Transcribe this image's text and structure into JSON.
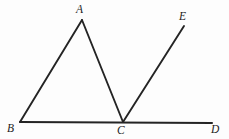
{
  "figure": {
    "kind": "geometry-line-diagram",
    "width": 229,
    "height": 139,
    "background_color": "#fdfdfd",
    "stroke_color": "#242424",
    "label_color": "#1c1c1c"
  },
  "labels": {
    "a": "A",
    "b": "B",
    "c": "C",
    "d": "D",
    "e": "E"
  },
  "points": {
    "A": {
      "x": 82,
      "y": 20
    },
    "B": {
      "x": 20,
      "y": 122
    },
    "C": {
      "x": 123,
      "y": 122
    },
    "D": {
      "x": 212,
      "y": 123
    },
    "E": {
      "x": 184,
      "y": 26
    }
  },
  "segments": [
    {
      "name": "segment-BA",
      "from": "B",
      "to": "A",
      "width": 1.9
    },
    {
      "name": "segment-AC",
      "from": "A",
      "to": "C",
      "width": 1.9
    },
    {
      "name": "segment-CE",
      "from": "C",
      "to": "E",
      "width": 1.9
    },
    {
      "name": "segment-BD",
      "from": "B",
      "to": "D",
      "width": 2.1
    }
  ]
}
